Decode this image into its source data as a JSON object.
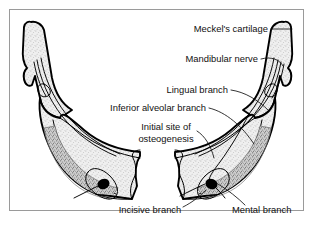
{
  "figure": {
    "frame_border_color": "#9a9a9a",
    "background_color": "#ffffff"
  },
  "labels": {
    "meckels_cartilage": "Meckel's cartilage",
    "mandibular_nerve": "Mandibular nerve",
    "lingual_branch": "Lingual branch",
    "inferior_alveolar_branch": "Inferior alveolar branch",
    "initial_site_line1": "Initial site of",
    "initial_site_line2": "osteogenesis",
    "incisive_branch": "Incisive branch",
    "mental_branch": "Mental branch"
  },
  "colors": {
    "outline": "#000000",
    "text": "#111111",
    "bone_fill_light": "#e8e8e8",
    "ossification_fill": "#b8b8b8",
    "foramen_fill": "#000000",
    "leader_line": "#111111"
  },
  "structures": [
    {
      "name": "left-ramus",
      "label_ref": "meckels_cartilage",
      "fill": "stipple-light"
    },
    {
      "name": "right-ramus",
      "label_ref": "meckels_cartilage",
      "fill": "stipple-light"
    },
    {
      "name": "left-body",
      "fill": "stipple-light"
    },
    {
      "name": "right-body",
      "fill": "stipple-light"
    },
    {
      "name": "left-ossification-band",
      "label_ref": "initial_site_line1",
      "fill": "stipple-dark"
    },
    {
      "name": "right-ossification-band",
      "label_ref": "initial_site_line1",
      "fill": "stipple-dark"
    },
    {
      "name": "left-mental-foramen",
      "label_ref": "mental_branch",
      "fill": "solid-black"
    },
    {
      "name": "right-mental-foramen",
      "label_ref": "mental_branch",
      "fill": "solid-black"
    },
    {
      "name": "symphysis-gap",
      "fill": "none"
    }
  ]
}
